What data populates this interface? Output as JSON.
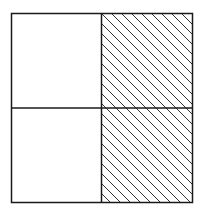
{
  "figure": {
    "grid": {
      "rows": 2,
      "cols": 2
    },
    "shaded_cells": [
      [
        0,
        1
      ],
      [
        1,
        1
      ]
    ],
    "shaded_fraction": "1/2",
    "colors": {
      "stroke": "#1a1a1a",
      "hatch": "#333333",
      "background": "#ffffff"
    }
  }
}
